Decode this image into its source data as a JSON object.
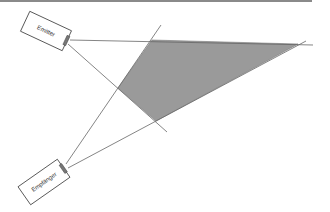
{
  "diagram": {
    "emitter": {
      "label": "Emitter"
    },
    "receiver": {
      "label": "Empfänger"
    },
    "overlap_region": {
      "fill": "#9a9a9a",
      "description": "overlap area"
    },
    "line_color": "#555555"
  }
}
